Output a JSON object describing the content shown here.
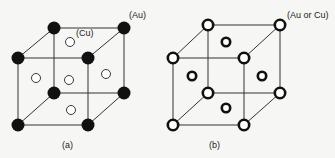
{
  "figure": {
    "background": "#f6f6f4",
    "line_color": "#333333",
    "panels": [
      {
        "id": "a",
        "caption": "(a)",
        "corner_label": "(Au)",
        "face_label": "(Cu)",
        "corner_atom_style": "filled-black",
        "face_atom_style": "open-thin",
        "description": "Ordered Cu3Au: Au at cube corners, Cu at face centers"
      },
      {
        "id": "b",
        "caption": "(b)",
        "corner_label": "(Au or Cu)",
        "corner_atom_style": "open-thick",
        "face_atom_style": "open-thick",
        "description": "Disordered FCC: Au or Cu randomly on all sites"
      }
    ]
  }
}
